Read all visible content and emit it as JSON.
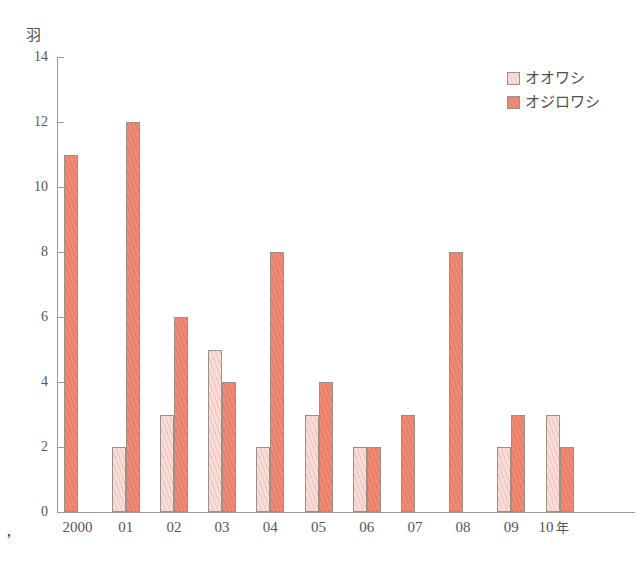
{
  "chart_data": {
    "type": "bar",
    "title": "",
    "subtitle": "",
    "xlabel": "",
    "ylabel": "羽",
    "x_axis_suffix": "年",
    "ylim": [
      0,
      14
    ],
    "y_ticks": [
      0,
      2,
      4,
      6,
      8,
      10,
      12,
      14
    ],
    "grid": false,
    "legend_position": "top-right",
    "categories": [
      "2000",
      "01",
      "02",
      "03",
      "04",
      "05",
      "06",
      "07",
      "08",
      "09",
      "10"
    ],
    "series": [
      {
        "name": "オオワシ",
        "color": "#f8ddd8",
        "values": [
          null,
          2,
          3,
          5,
          2,
          3,
          2,
          null,
          null,
          2,
          3
        ]
      },
      {
        "name": "オジロワシ",
        "color": "#f18a74",
        "values": [
          11,
          12,
          6,
          4,
          8,
          4,
          2,
          3,
          8,
          3,
          2
        ]
      }
    ]
  },
  "axis": {
    "unit_label": "羽",
    "y_tick_labels": [
      "0",
      "2",
      "4",
      "6",
      "8",
      "10",
      "12",
      "14"
    ],
    "x_tick_labels": [
      "2000",
      "01",
      "02",
      "03",
      "04",
      "05",
      "06",
      "07",
      "08",
      "09",
      "10"
    ],
    "x_last_suffix": "年"
  },
  "legend": {
    "items": [
      {
        "label": "オオワシ",
        "swatch": "light"
      },
      {
        "label": "オジロワシ",
        "swatch": "dark"
      }
    ]
  },
  "artifacts": {
    "scan_mark": "’"
  }
}
